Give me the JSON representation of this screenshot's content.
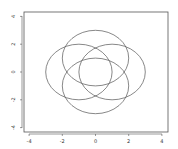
{
  "chart_data": {
    "type": "line",
    "title": "",
    "xlabel": "",
    "ylabel": "",
    "xlim": [
      -4.2,
      4.2
    ],
    "ylim": [
      -4.3,
      4.3
    ],
    "x_ticks": [
      "-4",
      "-2",
      "0",
      "2",
      "4"
    ],
    "y_ticks": [
      "4",
      "2",
      "0",
      "-2",
      "-4"
    ],
    "grid": false,
    "legend": null,
    "series": [
      {
        "name": "circle-left",
        "shape": "circle",
        "center": [
          -1,
          0
        ],
        "radius": 2
      },
      {
        "name": "circle-right",
        "shape": "circle",
        "center": [
          1,
          0
        ],
        "radius": 2
      },
      {
        "name": "circle-top",
        "shape": "circle",
        "center": [
          0,
          1
        ],
        "radius": 2
      },
      {
        "name": "circle-bottom",
        "shape": "circle",
        "center": [
          0,
          -1
        ],
        "radius": 2
      }
    ],
    "line_color": "#555555"
  }
}
